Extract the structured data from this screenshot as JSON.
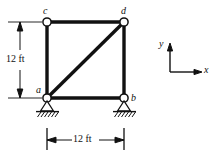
{
  "figure": {
    "type": "structural-truss-diagram",
    "stroke_color": "#111111",
    "background_color": "#ffffff"
  },
  "joints": [
    {
      "id": "c",
      "label": "c",
      "x": 47,
      "y": 22,
      "support": "none"
    },
    {
      "id": "d",
      "label": "d",
      "x": 124,
      "y": 22,
      "support": "none"
    },
    {
      "id": "a",
      "label": "a",
      "x": 47,
      "y": 98,
      "support": "pin"
    },
    {
      "id": "b",
      "label": "b",
      "x": 124,
      "y": 98,
      "support": "pin"
    }
  ],
  "joint_labels": {
    "c": "c",
    "d": "d",
    "a": "a",
    "b": "b"
  },
  "members": [
    {
      "name": "member-cd",
      "from": "c",
      "to": "d"
    },
    {
      "name": "member-ac",
      "from": "a",
      "to": "c"
    },
    {
      "name": "member-bd",
      "from": "b",
      "to": "d"
    },
    {
      "name": "member-ab",
      "from": "a",
      "to": "b"
    },
    {
      "name": "member-ad-diagonal",
      "from": "a",
      "to": "d"
    }
  ],
  "dimensions": {
    "vertical": {
      "label": "12 ft",
      "value": 12,
      "unit": "ft"
    },
    "horizontal": {
      "label": "12 ft",
      "value": 12,
      "unit": "ft"
    }
  },
  "axes": {
    "x_label": "x",
    "y_label": "y"
  },
  "supports": {
    "a": "pin-support-hatched",
    "b": "pin-support-hatched"
  }
}
